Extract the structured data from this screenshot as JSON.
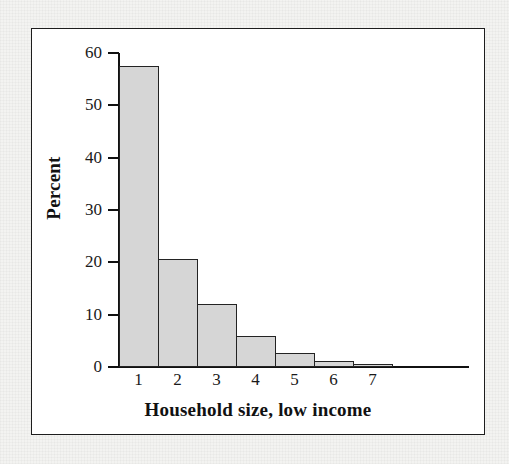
{
  "figure": {
    "frame_color": "#1d1d1d",
    "background_color": "#ffffff",
    "page_background_color": "#f3f3f1"
  },
  "chart_data": {
    "type": "bar",
    "title": "",
    "xlabel": "Household size, low income",
    "ylabel": "Percent",
    "categories": [
      "1",
      "2",
      "3",
      "4",
      "5",
      "6",
      "7"
    ],
    "values": [
      57.5,
      20.7,
      12.0,
      6.0,
      2.6,
      1.2,
      0.6
    ],
    "ylim": [
      0,
      60
    ],
    "yticks": [
      0,
      10,
      20,
      30,
      40,
      50,
      60
    ],
    "ytick_labels": [
      "0",
      "10",
      "20",
      "30",
      "40",
      "50",
      "60"
    ],
    "grid": false,
    "legend": null,
    "bar_fill_color": "#d6d6d6",
    "bar_edge_color": "#232323",
    "axis_color": "#111111"
  }
}
